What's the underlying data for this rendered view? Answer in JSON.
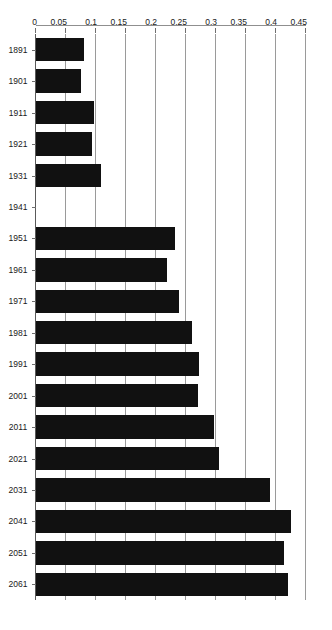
{
  "chart_data": {
    "type": "bar",
    "orientation": "horizontal",
    "title": "",
    "subtitle": "",
    "xlabel": "",
    "ylabel": "",
    "categories": [
      "1891",
      "1901",
      "1911",
      "1921",
      "1931",
      "1941",
      "1951",
      "1961",
      "1971",
      "1981",
      "1991",
      "2001",
      "2011",
      "2021",
      "2031",
      "2041",
      "2051",
      "2061"
    ],
    "values": [
      0.08,
      0.075,
      0.097,
      0.093,
      0.108,
      0,
      0.232,
      0.218,
      0.238,
      0.26,
      0.272,
      0.27,
      0.297,
      0.305,
      0.39,
      0.425,
      0.413,
      0.42
    ],
    "series": [
      {
        "name": "",
        "values": [
          0.08,
          0.075,
          0.097,
          0.093,
          0.108,
          0,
          0.232,
          0.218,
          0.238,
          0.26,
          0.272,
          0.27,
          0.297,
          0.305,
          0.39,
          0.425,
          0.413,
          0.42
        ]
      }
    ],
    "value_axis": {
      "min": 0,
      "max": 0.45,
      "tick_step": 0.05,
      "tick_labels": [
        "0.45",
        "0.4",
        "0.35",
        "0.3",
        "0.25",
        "0.2",
        "0.15",
        "0.1",
        "0.05",
        "0"
      ],
      "tick_values": [
        0.45,
        0.4,
        0.35,
        0.3,
        0.25,
        0.2,
        0.15,
        0.1,
        0.05,
        0
      ]
    },
    "category_axis": {
      "tick_labels": [
        "2061",
        "2051",
        "2041",
        "2031",
        "2021",
        "2011",
        "2001",
        "1991",
        "1981",
        "1971",
        "1961",
        "1951",
        "1941",
        "1931",
        "1921",
        "1911",
        "1901",
        "1891"
      ],
      "order": "top-to-bottom"
    },
    "grid": {
      "value_gridlines": true,
      "category_gridlines": false
    },
    "legend": {
      "visible": false,
      "entries": []
    },
    "annotations": [],
    "colors": {
      "bar": "#111111",
      "gridline": "#9a9a9a",
      "axis": "#8f8f8f",
      "text": "#1a1a1a",
      "background": "#ffffff"
    }
  }
}
